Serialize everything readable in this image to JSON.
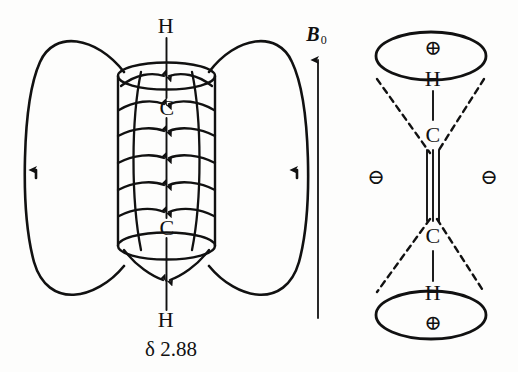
{
  "figure": {
    "background_color": "#fdfdfc",
    "ink_color": "#111111"
  },
  "left_panel": {
    "name": "induced-field-diagram",
    "top_hydrogen": "H",
    "top_carbon": "C",
    "bottom_carbon": "C",
    "bottom_hydrogen": "H",
    "chemical_shift": "δ 2.88",
    "field_loop_left": "field-line-loop-left",
    "field_loop_right": "field-line-loop-right",
    "cylinder_label": "pi-electron-cylinder",
    "internal_arrow_count": 10
  },
  "center_panel": {
    "name": "applied-field-axis",
    "label_symbol": "B",
    "label_subscript": "0",
    "arrow_direction": "up"
  },
  "right_panel": {
    "name": "shielding-cone-diagram",
    "top_charge": "⊕",
    "top_hydrogen": "H",
    "top_carbon": "C",
    "bottom_carbon": "C",
    "bottom_hydrogen": "H",
    "bottom_charge": "⊕",
    "left_charge": "⊖",
    "right_charge": "⊖",
    "bond_type": "triple",
    "cone_style": "dashed"
  }
}
